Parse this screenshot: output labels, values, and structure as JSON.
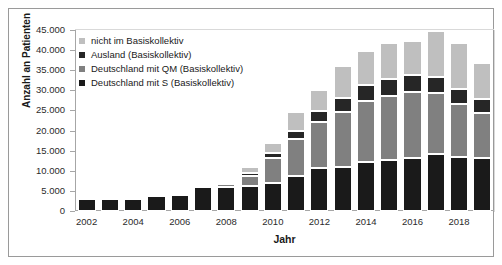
{
  "chart_data": {
    "type": "bar",
    "stacked": true,
    "title": "",
    "xlabel": "Jahr",
    "ylabel": "Anzahl an Patienten",
    "ylim": [
      0,
      45000
    ],
    "ytick_values": [
      0,
      5000,
      10000,
      15000,
      20000,
      25000,
      30000,
      35000,
      40000,
      45000
    ],
    "ytick_labels": [
      "0",
      "5.000",
      "10.000",
      "15.000",
      "20.000",
      "25.000",
      "30.000",
      "35.000",
      "40.000",
      "45.000"
    ],
    "grid": false,
    "legend_position": "top-left",
    "categories": [
      2002,
      2003,
      2004,
      2005,
      2006,
      2007,
      2008,
      2009,
      2010,
      2011,
      2012,
      2013,
      2014,
      2015,
      2016,
      2017,
      2018,
      2019
    ],
    "xtick_labels": [
      "2002",
      "2004",
      "2006",
      "2008",
      "2010",
      "2012",
      "2014",
      "2016",
      "2018"
    ],
    "series": [
      {
        "name": "Deutschland mit S (Basiskollektiv)",
        "color": "#1a1a1a",
        "values": [
          3000,
          3100,
          3200,
          3700,
          4000,
          5900,
          6000,
          6200,
          6900,
          8700,
          10800,
          11000,
          12100,
          12700,
          13200,
          14200,
          13500,
          13100
        ]
      },
      {
        "name": "Deutschland mit QM (Basiskollektiv)",
        "color": "#808080",
        "values": [
          0,
          0,
          0,
          0,
          400,
          500,
          600,
          2400,
          6200,
          9300,
          11400,
          13700,
          15300,
          16000,
          16400,
          15200,
          13000,
          11300
        ]
      },
      {
        "name": "Ausland (Basiskollektiv)",
        "color": "#262626",
        "values": [
          0,
          100,
          100,
          200,
          400,
          400,
          500,
          900,
          1300,
          1900,
          2600,
          3400,
          3900,
          4000,
          4200,
          4000,
          3800,
          3500
        ]
      },
      {
        "name": "nicht im Basiskollektiv",
        "color": "#bfbfbf",
        "values": [
          0,
          0,
          0,
          200,
          400,
          400,
          500,
          1400,
          2600,
          4600,
          5200,
          7900,
          8400,
          9100,
          8400,
          11400,
          11500,
          8800
        ]
      }
    ]
  },
  "legend": {
    "items": [
      {
        "label": "nicht im Basiskollektiv",
        "color": "#bfbfbf"
      },
      {
        "label": "Ausland (Basiskollektiv)",
        "color": "#262626"
      },
      {
        "label": "Deutschland mit QM (Basiskollektiv)",
        "color": "#808080"
      },
      {
        "label": "Deutschland mit S (Basiskollektiv)",
        "color": "#1a1a1a"
      }
    ]
  },
  "axes": {
    "x_title": "Jahr",
    "y_title": "Anzahl an Patienten"
  }
}
